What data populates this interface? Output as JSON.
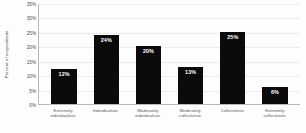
{
  "chart_data": {
    "type": "bar",
    "title": "",
    "xlabel": "",
    "ylabel": "Percent of respondents",
    "categories": [
      "Extremely individualistic",
      "Individualistic",
      "Moderately individualistic",
      "Moderately collectivistic",
      "Collectivistic",
      "Extremely collectivistic"
    ],
    "values": [
      12,
      24,
      20,
      13,
      25,
      6
    ],
    "value_labels": [
      "12%",
      "24%",
      "20%",
      "13%",
      "25%",
      "6%"
    ],
    "ylim": [
      0,
      35
    ],
    "yticks": [
      0,
      5,
      10,
      15,
      20,
      25,
      30,
      35
    ],
    "ytick_labels": [
      "0%",
      "5%",
      "10%",
      "15%",
      "20%",
      "25%",
      "30%",
      "35%"
    ],
    "grid": true,
    "legend": false,
    "bar_color": "#0b0b0b",
    "value_label_color": "#ffffff",
    "gridline_color": "#ececec",
    "axis_color": "#b9b9b9",
    "background": "#fdfdfd"
  },
  "axes": {
    "y_title": "Percent of respondents"
  }
}
